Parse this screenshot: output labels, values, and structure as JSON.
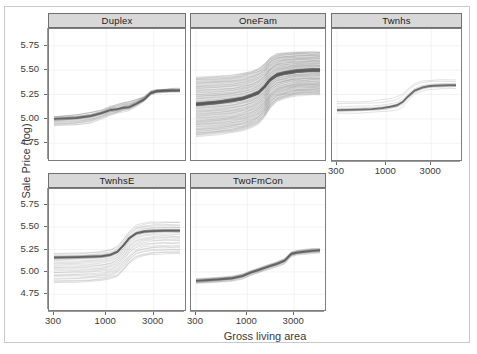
{
  "chart_data": {
    "type": "line",
    "title": "",
    "subtitle": "",
    "xlabel": "Gross living area",
    "ylabel": "Sale Price (log)",
    "xscale": "log",
    "xlim": [
      300,
      5500
    ],
    "ylim": [
      4.62,
      5.88
    ],
    "grid": true,
    "legend": "none",
    "x_ticks": [
      "300",
      "1000",
      "3000"
    ],
    "x_tick_values": [
      300,
      1000,
      3000
    ],
    "y_ticks": [
      "4.75",
      "5.00",
      "5.25",
      "5.50",
      "5.75"
    ],
    "y_tick_values": [
      4.75,
      5.0,
      5.25,
      5.5,
      5.75
    ],
    "facet_variable": "Building Type",
    "facets": [
      {
        "label": "Duplex",
        "row": 0,
        "col": 0,
        "n_curves": 18,
        "x": [
          300,
          500,
          700,
          900,
          1100,
          1300,
          1500,
          1700,
          2000,
          2400,
          2800,
          3200,
          3800,
          4600,
          5500
        ],
        "average_curve": [
          5.0,
          5.01,
          5.03,
          5.06,
          5.09,
          5.1,
          5.115,
          5.12,
          5.155,
          5.2,
          5.265,
          5.283,
          5.288,
          5.29,
          5.29
        ],
        "spread_low": [
          4.93,
          4.94,
          4.96,
          5.0,
          5.04,
          5.06,
          5.08,
          5.09,
          5.13,
          5.18,
          5.25,
          5.27,
          5.275,
          5.28,
          5.28
        ],
        "spread_high": [
          5.03,
          5.05,
          5.07,
          5.1,
          5.13,
          5.15,
          5.175,
          5.18,
          5.2,
          5.23,
          5.285,
          5.3,
          5.305,
          5.31,
          5.31
        ]
      },
      {
        "label": "OneFam",
        "row": 0,
        "col": 1,
        "n_curves": 180,
        "x": [
          300,
          500,
          700,
          900,
          1100,
          1300,
          1500,
          1700,
          2000,
          2400,
          2800,
          3200,
          3800,
          4600,
          5500
        ],
        "average_curve": [
          5.15,
          5.17,
          5.19,
          5.21,
          5.24,
          5.27,
          5.33,
          5.4,
          5.45,
          5.47,
          5.48,
          5.49,
          5.495,
          5.5,
          5.5
        ],
        "spread_low": [
          4.82,
          4.84,
          4.86,
          4.88,
          4.91,
          4.95,
          5.02,
          5.11,
          5.18,
          5.21,
          5.23,
          5.24,
          5.245,
          5.25,
          5.25
        ],
        "spread_high": [
          5.43,
          5.44,
          5.45,
          5.47,
          5.49,
          5.52,
          5.57,
          5.63,
          5.67,
          5.68,
          5.685,
          5.69,
          5.69,
          5.69,
          5.69
        ]
      },
      {
        "label": "Twnhs",
        "row": 0,
        "col": 2,
        "n_curves": 6,
        "x": [
          300,
          500,
          700,
          900,
          1100,
          1300,
          1500,
          1700,
          2000,
          2400,
          2800,
          3200,
          3800,
          4600,
          5500
        ],
        "average_curve": [
          5.09,
          5.095,
          5.1,
          5.11,
          5.125,
          5.14,
          5.175,
          5.23,
          5.29,
          5.32,
          5.335,
          5.34,
          5.342,
          5.345,
          5.345
        ],
        "spread_low": [
          5.055,
          5.06,
          5.065,
          5.07,
          5.08,
          5.09,
          5.12,
          5.18,
          5.25,
          5.285,
          5.3,
          5.305,
          5.31,
          5.31,
          5.31
        ],
        "spread_high": [
          5.175,
          5.18,
          5.185,
          5.195,
          5.21,
          5.225,
          5.26,
          5.31,
          5.36,
          5.385,
          5.395,
          5.4,
          5.4,
          5.4,
          5.4
        ]
      },
      {
        "label": "TwnhsE",
        "row": 1,
        "col": 0,
        "n_curves": 26,
        "x": [
          300,
          500,
          700,
          900,
          1100,
          1300,
          1500,
          1700,
          2000,
          2400,
          2800,
          3200,
          3800,
          4600,
          5500
        ],
        "average_curve": [
          5.16,
          5.165,
          5.17,
          5.175,
          5.19,
          5.225,
          5.3,
          5.375,
          5.43,
          5.45,
          5.455,
          5.458,
          5.46,
          5.46,
          5.46
        ],
        "spread_low": [
          4.88,
          4.885,
          4.89,
          4.9,
          4.92,
          4.95,
          5.02,
          5.09,
          5.15,
          5.18,
          5.19,
          5.195,
          5.2,
          5.2,
          5.2
        ],
        "spread_high": [
          5.21,
          5.215,
          5.22,
          5.23,
          5.25,
          5.29,
          5.37,
          5.45,
          5.52,
          5.545,
          5.555,
          5.558,
          5.56,
          5.56,
          5.56
        ]
      },
      {
        "label": "TwoFmCon",
        "row": 1,
        "col": 1,
        "n_curves": 14,
        "x": [
          300,
          500,
          700,
          900,
          1100,
          1300,
          1500,
          1700,
          2000,
          2400,
          2800,
          3200,
          3800,
          4600,
          5500
        ],
        "average_curve": [
          4.9,
          4.915,
          4.93,
          4.955,
          4.995,
          5.02,
          5.045,
          5.065,
          5.09,
          5.125,
          5.2,
          5.215,
          5.225,
          5.235,
          5.24
        ],
        "spread_low": [
          4.87,
          4.885,
          4.9,
          4.925,
          4.965,
          4.99,
          5.015,
          5.035,
          5.06,
          5.095,
          5.175,
          5.19,
          5.2,
          5.21,
          5.215
        ],
        "spread_high": [
          4.925,
          4.94,
          4.955,
          4.98,
          5.02,
          5.045,
          5.07,
          5.09,
          5.115,
          5.15,
          5.225,
          5.24,
          5.25,
          5.26,
          5.265
        ]
      }
    ]
  },
  "axes": {
    "y_title": "Sale Price (log)",
    "x_title": "Gross living area",
    "y_tick_labels": [
      "5.75",
      "5.50",
      "5.25",
      "5.00",
      "4.75"
    ],
    "x_tick_labels": [
      "300",
      "1000",
      "3000"
    ]
  },
  "panels": {
    "duplex": "Duplex",
    "onefam": "OneFam",
    "twnhs": "Twnhs",
    "twnhse": "TwnhsE",
    "twofmcon": "TwoFmCon"
  },
  "colors": {
    "line": "#6b6b6b",
    "average_line": "#555555",
    "strip_background": "#d8d8d8",
    "strip_border": "#6f6f6f",
    "panel_border": "#7d7d7d",
    "grid": "#eeeeee",
    "text": "#3a3a3a",
    "frame": "#c9c9c9",
    "background": "#ffffff"
  }
}
